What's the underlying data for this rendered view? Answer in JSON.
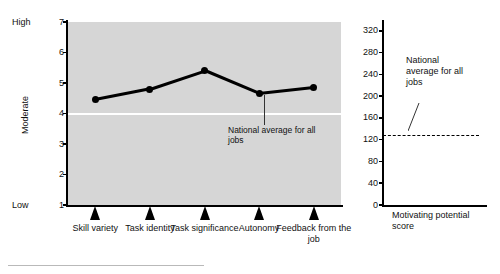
{
  "chart_data": [
    {
      "type": "line",
      "id": "job-characteristics-profile",
      "title": "",
      "xlabel": "",
      "ylabel": "Moderate",
      "categories": [
        "Skill variety",
        "Task identity",
        "Task significance",
        "Autonomy",
        "Feedback from the job"
      ],
      "values": [
        4.45,
        4.8,
        5.4,
        4.65,
        4.85
      ],
      "ylim": [
        1,
        7
      ],
      "yticks": [
        "7",
        "6",
        "5",
        "4",
        "3",
        "2",
        "1"
      ],
      "scale_anchors": {
        "high": "High",
        "moderate": "Moderate",
        "low": "Low"
      },
      "reference_line": {
        "value": 4.0,
        "label": "National average for all jobs",
        "style": "solid-white"
      },
      "grid": false,
      "legend": "none",
      "plot_background": "#d6d6d6",
      "line_color": "#000000"
    },
    {
      "type": "line",
      "id": "motivating-potential-score",
      "title": "",
      "xlabel": "Motivating potential score",
      "ylabel": "",
      "categories": [
        "Motivating potential score"
      ],
      "values": [
        128
      ],
      "ylim": [
        0,
        340
      ],
      "yticks": [
        "320",
        "280",
        "240",
        "200",
        "160",
        "120",
        "80",
        "40",
        "0"
      ],
      "reference_line": {
        "value": 128,
        "label": "National average for all jobs",
        "style": "dashed"
      },
      "grid": false,
      "legend": "none",
      "plot_background": "#ffffff",
      "line_color": "#000000"
    }
  ],
  "left": {
    "anchors": {
      "high": "High",
      "moderate": "Moderate",
      "low": "Low"
    },
    "yticks": [
      "7",
      "6",
      "5",
      "4",
      "3",
      "2",
      "1"
    ],
    "xlabels": [
      "Skill variety",
      "Task identity",
      "Task significance",
      "Autonomy",
      "Feedback from the job"
    ],
    "callout": "National average for all jobs"
  },
  "right": {
    "yticks": [
      "320",
      "280",
      "240",
      "200",
      "160",
      "120",
      "80",
      "40",
      "0"
    ],
    "callout": "National average for all jobs",
    "xlabel": "Motivating potential score"
  }
}
